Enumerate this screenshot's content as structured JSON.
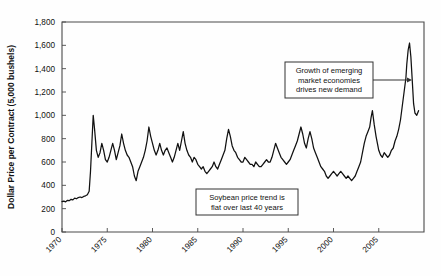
{
  "chart_data": {
    "type": "line",
    "title": "",
    "xlabel": "",
    "ylabel": "Dollar Price per Contract (5,000 bushels)",
    "xlim": [
      1970,
      2010
    ],
    "ylim": [
      0,
      1800
    ],
    "grid": false,
    "legend": null,
    "xticks": [
      "1970",
      "1975",
      "1980",
      "1985",
      "1990",
      "1995",
      "2000",
      "2005"
    ],
    "xtick_values": [
      1970,
      1975,
      1980,
      1985,
      1990,
      1995,
      2000,
      2005
    ],
    "yticks": [
      "0",
      "200",
      "400",
      "600",
      "800",
      "1,000",
      "1,200",
      "1,400",
      "1,600",
      "1,800"
    ],
    "ytick_values": [
      0,
      200,
      400,
      600,
      800,
      1000,
      1200,
      1400,
      1600,
      1800
    ],
    "series": [
      {
        "name": "Soybean price per contract",
        "x": [
          1970.0,
          1970.2,
          1970.4,
          1970.6,
          1970.8,
          1971.0,
          1971.2,
          1971.4,
          1971.6,
          1971.8,
          1972.0,
          1972.2,
          1972.4,
          1972.6,
          1972.8,
          1973.0,
          1973.15,
          1973.3,
          1973.45,
          1973.6,
          1973.8,
          1974.0,
          1974.2,
          1974.4,
          1974.6,
          1974.8,
          1975.0,
          1975.2,
          1975.4,
          1975.6,
          1975.8,
          1976.0,
          1976.2,
          1976.4,
          1976.6,
          1976.8,
          1977.0,
          1977.2,
          1977.4,
          1977.6,
          1977.8,
          1978.0,
          1978.2,
          1978.4,
          1978.6,
          1978.8,
          1979.0,
          1979.2,
          1979.4,
          1979.6,
          1979.8,
          1980.0,
          1980.2,
          1980.4,
          1980.6,
          1980.8,
          1981.0,
          1981.2,
          1981.4,
          1981.6,
          1981.8,
          1982.0,
          1982.2,
          1982.4,
          1982.6,
          1982.8,
          1983.0,
          1983.2,
          1983.4,
          1983.6,
          1983.8,
          1984.0,
          1984.2,
          1984.4,
          1984.6,
          1984.8,
          1985.0,
          1985.2,
          1985.4,
          1985.6,
          1985.8,
          1986.0,
          1986.2,
          1986.4,
          1986.6,
          1986.8,
          1987.0,
          1987.2,
          1987.4,
          1987.6,
          1987.8,
          1988.0,
          1988.2,
          1988.4,
          1988.6,
          1988.8,
          1989.0,
          1989.2,
          1989.4,
          1989.6,
          1989.8,
          1990.0,
          1990.2,
          1990.4,
          1990.6,
          1990.8,
          1991.0,
          1991.2,
          1991.4,
          1991.6,
          1991.8,
          1992.0,
          1992.2,
          1992.4,
          1992.6,
          1992.8,
          1993.0,
          1993.2,
          1993.4,
          1993.6,
          1993.8,
          1994.0,
          1994.2,
          1994.4,
          1994.6,
          1994.8,
          1995.0,
          1995.2,
          1995.4,
          1995.6,
          1995.8,
          1996.0,
          1996.2,
          1996.4,
          1996.6,
          1996.8,
          1997.0,
          1997.2,
          1997.4,
          1997.6,
          1997.8,
          1998.0,
          1998.2,
          1998.4,
          1998.6,
          1998.8,
          1999.0,
          1999.2,
          1999.4,
          1999.6,
          1999.8,
          2000.0,
          2000.2,
          2000.4,
          2000.6,
          2000.8,
          2001.0,
          2001.2,
          2001.4,
          2001.6,
          2001.8,
          2002.0,
          2002.2,
          2002.4,
          2002.6,
          2002.8,
          2003.0,
          2003.2,
          2003.4,
          2003.6,
          2003.8,
          2004.0,
          2004.15,
          2004.3,
          2004.5,
          2004.7,
          2004.9,
          2005.0,
          2005.2,
          2005.4,
          2005.6,
          2005.8,
          2006.0,
          2006.2,
          2006.4,
          2006.6,
          2006.8,
          2007.0,
          2007.2,
          2007.4,
          2007.6,
          2007.8,
          2008.0,
          2008.1,
          2008.25,
          2008.4,
          2008.55,
          2008.7,
          2008.85,
          2009.0,
          2009.2,
          2009.4
        ],
        "y": [
          260,
          265,
          258,
          272,
          268,
          280,
          275,
          290,
          285,
          295,
          300,
          295,
          305,
          310,
          320,
          350,
          520,
          760,
          1000,
          880,
          700,
          640,
          680,
          760,
          700,
          620,
          600,
          640,
          700,
          760,
          700,
          620,
          680,
          740,
          840,
          760,
          700,
          660,
          640,
          600,
          560,
          480,
          440,
          520,
          560,
          600,
          640,
          700,
          780,
          900,
          820,
          760,
          700,
          660,
          700,
          760,
          700,
          660,
          700,
          720,
          680,
          640,
          600,
          640,
          700,
          760,
          700,
          780,
          860,
          760,
          700,
          660,
          640,
          600,
          640,
          620,
          580,
          560,
          540,
          560,
          520,
          500,
          520,
          540,
          560,
          600,
          560,
          540,
          580,
          620,
          660,
          700,
          800,
          880,
          820,
          740,
          700,
          680,
          640,
          620,
          600,
          600,
          640,
          620,
          600,
          580,
          580,
          560,
          600,
          580,
          560,
          560,
          580,
          600,
          620,
          600,
          600,
          640,
          700,
          760,
          720,
          680,
          640,
          620,
          600,
          580,
          600,
          620,
          660,
          700,
          740,
          780,
          840,
          900,
          840,
          760,
          720,
          800,
          860,
          800,
          720,
          680,
          640,
          600,
          560,
          540,
          520,
          480,
          460,
          480,
          500,
          520,
          500,
          480,
          500,
          520,
          500,
          480,
          460,
          480,
          460,
          440,
          460,
          480,
          520,
          560,
          600,
          680,
          760,
          820,
          860,
          900,
          980,
          1040,
          920,
          820,
          740,
          700,
          660,
          640,
          680,
          660,
          640,
          660,
          700,
          720,
          780,
          820,
          880,
          960,
          1080,
          1200,
          1320,
          1440,
          1560,
          1620,
          1500,
          1300,
          1100,
          1020,
          1000,
          1040
        ]
      }
    ],
    "annotations": [
      {
        "id": "annotation-emerging-markets",
        "lines": [
          "Growth of emerging",
          "market economies",
          "drives new demand"
        ],
        "box": {
          "x": 285,
          "y": 62,
          "width": 88,
          "height": 36
        },
        "arrow": {
          "x1": 373,
          "y1": 80,
          "x2": 412,
          "y2": 80
        }
      },
      {
        "id": "annotation-flat-trend",
        "lines": [
          "Soybean price trend is",
          "flat over last 40 years"
        ],
        "box": {
          "x": 196,
          "y": 189,
          "width": 102,
          "height": 26
        },
        "arrow": null
      }
    ],
    "colors": {
      "line": "#111111",
      "axis": "#4a4a4a",
      "text": "#111111",
      "background": "#ffffff",
      "annotation_border": "#333333"
    }
  },
  "plot_geometry": {
    "left": 62,
    "right": 424,
    "top": 22,
    "bottom": 232
  }
}
